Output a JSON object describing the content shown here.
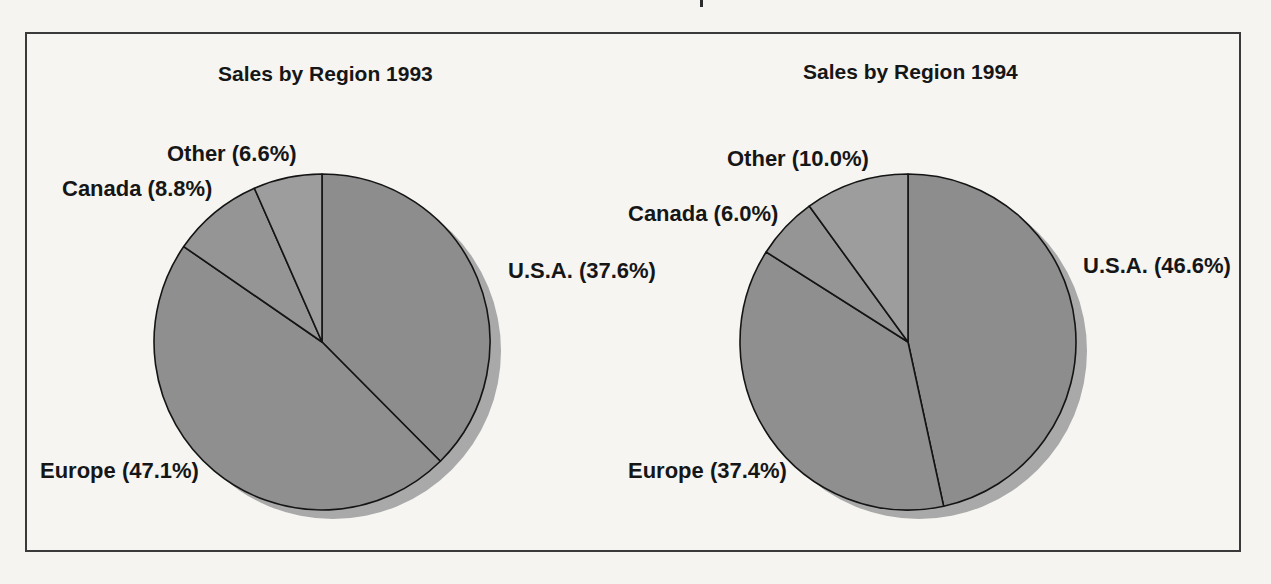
{
  "chart_data": [
    {
      "type": "pie",
      "title": "Sales by Region 1993",
      "categories": [
        "U.S.A.",
        "Europe",
        "Canada",
        "Other"
      ],
      "values": [
        37.6,
        47.1,
        8.8,
        6.6
      ],
      "labels": {
        "usa": "U.S.A. (37.6%)",
        "europe": "Europe (47.1%)",
        "canada": "Canada (8.8%)",
        "other": "Other (6.6%)"
      },
      "start_angle": "12 o'clock",
      "direction": "clockwise",
      "legend": "none - direct slice labels"
    },
    {
      "type": "pie",
      "title": "Sales by Region 1994",
      "categories": [
        "U.S.A.",
        "Europe",
        "Canada",
        "Other"
      ],
      "values": [
        46.6,
        37.4,
        6.0,
        10.0
      ],
      "labels": {
        "usa": "U.S.A. (46.6%)",
        "europe": "Europe (37.4%)",
        "canada": "Canada (6.0%)",
        "other": "Other (10.0%)"
      },
      "start_angle": "12 o'clock",
      "direction": "clockwise",
      "legend": "none - direct slice labels"
    }
  ],
  "pie_style": {
    "slice_fills": [
      "#8d8d8d",
      "#8f8f8f",
      "#959595",
      "#9d9d9d"
    ],
    "stroke": "#141414",
    "stroke_width": 1.6,
    "shadow_fill": "#a9a9a9",
    "shadow_offset_x": 11,
    "shadow_offset_y": 9
  },
  "colors": {
    "background": "#f5f4f1",
    "frame_border": "#3a3a3a",
    "text": "#161616"
  }
}
